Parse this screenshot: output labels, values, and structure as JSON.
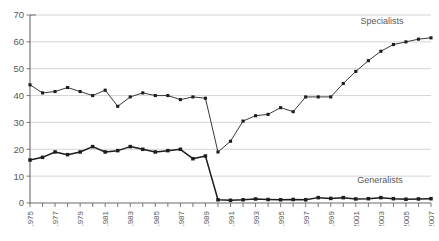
{
  "chart_data": {
    "type": "line",
    "title": "",
    "xlabel": "",
    "ylabel": "",
    "ylim": [
      0,
      70
    ],
    "yticks": [
      0,
      10,
      20,
      30,
      40,
      50,
      60,
      70
    ],
    "grid": true,
    "legend_position": "inline-right",
    "x": [
      1975,
      1976,
      1977,
      1978,
      1979,
      1980,
      1981,
      1982,
      1983,
      1984,
      1985,
      1986,
      1987,
      1988,
      1989,
      1990,
      1991,
      1992,
      1993,
      1994,
      1995,
      1996,
      1997,
      1998,
      1999,
      2000,
      2001,
      2002,
      2003,
      2004,
      2005,
      2006,
      2007
    ],
    "xtick_labels": [
      "1975",
      "1977",
      "1979",
      "1981",
      "1983",
      "1985",
      "1987",
      "1989",
      "1991",
      "1993",
      "1995",
      "1997",
      "1999",
      "2001",
      "2003",
      "2005",
      "2007"
    ],
    "series": [
      {
        "name": "Specialists",
        "values": [
          44,
          41,
          41.5,
          43,
          41.5,
          40,
          42,
          36,
          39.5,
          41,
          40,
          40,
          38.5,
          39.5,
          39,
          19,
          23,
          30.5,
          32.5,
          33,
          35.5,
          34,
          39.5,
          39.5,
          39.5,
          44.5,
          49,
          53,
          56.5,
          59,
          60,
          61,
          61.5
        ]
      },
      {
        "name": "Generalists",
        "values": [
          16,
          17,
          19,
          18,
          19,
          21,
          19,
          19.5,
          21,
          20,
          19,
          19.5,
          20,
          16.5,
          17.5,
          1.2,
          1,
          1.2,
          1.5,
          1.3,
          1.2,
          1.3,
          1.2,
          2,
          1.7,
          2,
          1.5,
          1.6,
          2,
          1.6,
          1.4,
          1.5,
          1.6
        ]
      }
    ]
  },
  "labels": {
    "specialists": "Specialists",
    "generalists": "Generalists"
  },
  "caption": ""
}
